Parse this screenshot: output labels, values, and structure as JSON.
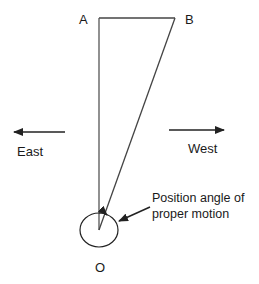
{
  "diagram": {
    "points": {
      "A": {
        "label": "A",
        "x": 99,
        "y": 18
      },
      "B": {
        "label": "B",
        "x": 175,
        "y": 18
      },
      "O": {
        "label": "O",
        "x": 99,
        "y": 230
      }
    },
    "directions": {
      "east": {
        "label": "East"
      },
      "west": {
        "label": "West"
      }
    },
    "annotation": {
      "line1": "Position angle of",
      "line2": "proper motion"
    },
    "colors": {
      "stroke": "#333333",
      "text": "#1a1a1a",
      "background": "#ffffff"
    }
  }
}
